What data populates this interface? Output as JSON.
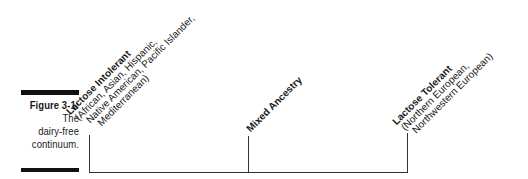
{
  "figure": {
    "number": "Figure 3-1:",
    "caption_lines": [
      "The",
      "dairy-free",
      "continuum."
    ]
  },
  "continuum": {
    "points": [
      {
        "title": "Lactose Intolerant",
        "details": [
          "(African, Asian, Hispanic,",
          "Native American, Pacific Islander,",
          "Mediterranean)"
        ]
      },
      {
        "title": "Mixed Ancestry",
        "details": []
      },
      {
        "title": "Lactose Tolerant",
        "details": [
          "(Northern European,",
          "Northwestern European)"
        ]
      }
    ]
  }
}
